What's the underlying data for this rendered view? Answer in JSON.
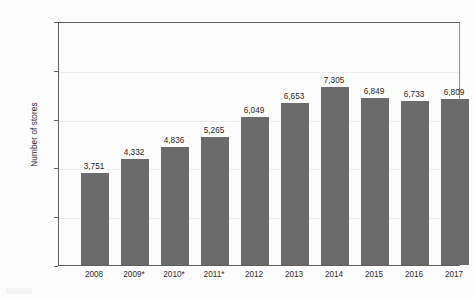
{
  "chart_data": {
    "type": "bar",
    "title": "",
    "subtitle": "",
    "xlabel": "",
    "ylabel": "Number of stores",
    "categories": [
      "2008",
      "2009*",
      "2010*",
      "2011*",
      "2012",
      "2013",
      "2014",
      "2015",
      "2016",
      "2017"
    ],
    "values": [
      3751,
      4332,
      4836,
      5265,
      6049,
      6653,
      7305,
      6849,
      6733,
      6809
    ],
    "value_labels": [
      "3,751",
      "4,332",
      "4,836",
      "5,265",
      "6,049",
      "6,653",
      "7,305",
      "6,849",
      "6,733",
      "6,809"
    ],
    "ylim": [
      0,
      10000
    ],
    "ytick_values": [
      0,
      2000,
      4000,
      6000,
      8000,
      10000
    ],
    "ytick_labels": [
      "0",
      "2,000",
      "4,000",
      "6,000",
      "8,000",
      "10,000"
    ],
    "grid": "horizontal",
    "legend": "none",
    "bar_color": "#6b6b6b",
    "gridline_color": "#ececec",
    "axis_color": "#5c5c5c",
    "text_color": "#231f20"
  }
}
